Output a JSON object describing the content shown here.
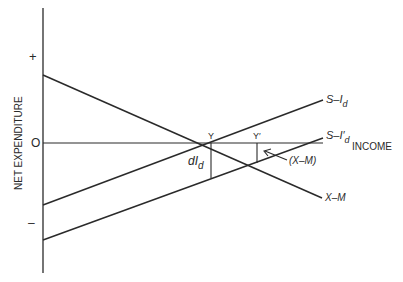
{
  "axis": {
    "y_title": "NET EXPENDITURE",
    "x_title": "INCOME",
    "plus": "+",
    "zero": "O",
    "minus": "–"
  },
  "lines": {
    "s_id": {
      "main": "S–I",
      "sub": "d"
    },
    "s_id_prime": {
      "main": "S–I′",
      "sub": "d"
    },
    "x_m": {
      "label": "X–M"
    }
  },
  "points": {
    "y": "Y",
    "y_prime": "Y′"
  },
  "annotations": {
    "d_id": {
      "main": "dI",
      "sub": "d"
    },
    "x_m_gap": "(X–M)"
  },
  "colors": {
    "ink": "#2a2a2a",
    "background": "#ffffff"
  }
}
